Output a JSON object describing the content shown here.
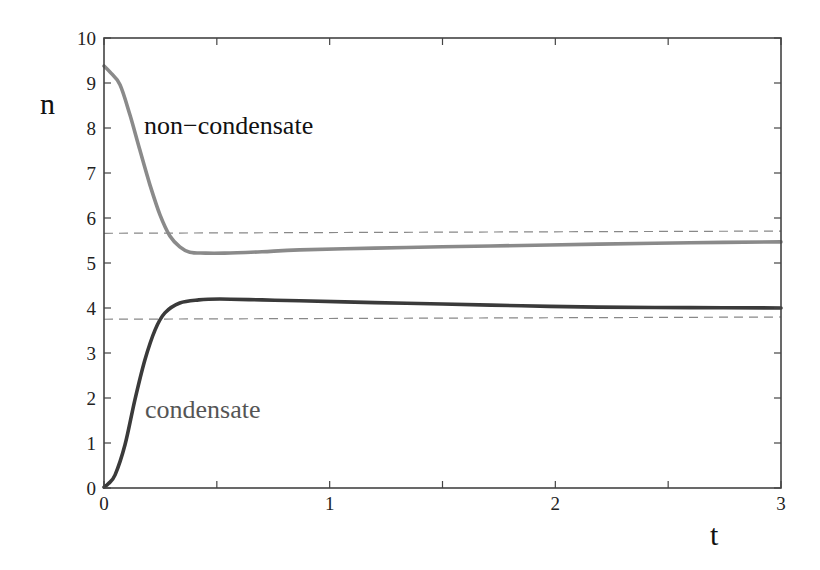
{
  "chart_data": {
    "type": "line",
    "title": "",
    "xlabel": "t",
    "ylabel": "n",
    "xlim": [
      0,
      3
    ],
    "ylim": [
      0,
      10
    ],
    "grid": false,
    "legend": "none (inline curve annotations)",
    "x_ticks": [
      0,
      1,
      2,
      3
    ],
    "x_minor_ticks": [
      0.5,
      1.5,
      2.5
    ],
    "y_ticks": [
      0,
      1,
      2,
      3,
      4,
      5,
      6,
      7,
      8,
      9,
      10
    ],
    "series": [
      {
        "name": "non−condensate",
        "style": "solid",
        "color": "#8a8a8a",
        "x": [
          0,
          0.027,
          0.071,
          0.115,
          0.159,
          0.204,
          0.248,
          0.292,
          0.336,
          0.38,
          0.45,
          0.535,
          0.7,
          0.867,
          1.2,
          1.5,
          1.85,
          2.19,
          2.6,
          3.0
        ],
        "y": [
          9.38,
          9.24,
          8.96,
          8.29,
          7.51,
          6.73,
          6.07,
          5.6,
          5.36,
          5.24,
          5.22,
          5.22,
          5.25,
          5.29,
          5.33,
          5.36,
          5.39,
          5.42,
          5.45,
          5.47
        ]
      },
      {
        "name": "condensate",
        "style": "solid",
        "color": "#3a3a3a",
        "x": [
          0,
          0.02,
          0.049,
          0.093,
          0.137,
          0.181,
          0.226,
          0.27,
          0.336,
          0.42,
          0.513,
          0.7,
          0.867,
          1.2,
          1.5,
          1.85,
          2.19,
          2.6,
          3.0
        ],
        "y": [
          0.02,
          0.1,
          0.29,
          0.96,
          1.96,
          2.84,
          3.51,
          3.89,
          4.11,
          4.18,
          4.2,
          4.18,
          4.16,
          4.12,
          4.09,
          4.05,
          4.02,
          4.01,
          4.0
        ]
      },
      {
        "name": "upper dashed reference",
        "style": "dashed",
        "color": "#888888",
        "x": [
          0,
          3
        ],
        "y": [
          5.66,
          5.71
        ]
      },
      {
        "name": "lower dashed reference",
        "style": "dashed",
        "color": "#888888",
        "x": [
          0,
          3
        ],
        "y": [
          3.75,
          3.8
        ]
      }
    ],
    "annotations": [
      {
        "text": "non−condensate",
        "x": 0.18,
        "y": 7.9,
        "color": "#111111"
      },
      {
        "text": "condensate",
        "x": 0.18,
        "y": 1.55,
        "color": "#555555"
      }
    ]
  },
  "labels": {
    "xlabel": "t",
    "ylabel": "n",
    "annot_noncondensate": "non−condensate",
    "annot_condensate": "condensate"
  }
}
